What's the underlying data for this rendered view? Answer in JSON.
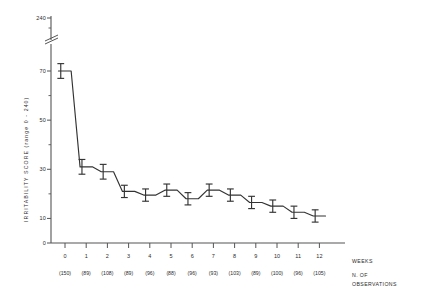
{
  "chart_data": {
    "type": "line",
    "title": "",
    "subtitle": "",
    "xlabel": "WEEKS",
    "ylabel": "IRRITABILITY SCORE  (range 0 - 240)",
    "ylabel_main": "IRRITABILITY SCORE",
    "ylabel_range": "(range 0 - 240)",
    "legend_position": "none",
    "grid": false,
    "axis_break": true,
    "axis_break_top_label": "240",
    "x": [
      0,
      1,
      2,
      3,
      4,
      5,
      6,
      7,
      8,
      9,
      10,
      11,
      12
    ],
    "categories": [
      "0",
      "1",
      "2",
      "3",
      "4",
      "5",
      "6",
      "7",
      "8",
      "9",
      "10",
      "11",
      "12"
    ],
    "values": [
      70.0,
      31.0,
      29.0,
      21.0,
      19.5,
      21.5,
      18.0,
      21.5,
      19.5,
      16.5,
      15.0,
      12.5,
      11.0
    ],
    "errors": [
      3.0,
      3.0,
      3.0,
      2.5,
      2.5,
      2.5,
      2.5,
      2.5,
      2.5,
      2.5,
      2.5,
      2.5,
      2.5
    ],
    "n_observations": [
      150,
      89,
      108,
      89,
      96,
      88,
      96,
      93,
      103,
      89,
      100,
      96,
      105
    ],
    "n_observations_display": [
      "(150)",
      "(89)",
      "(108)",
      "(89)",
      "(96)",
      "(88)",
      "(96)",
      "(93)",
      "(103)",
      "(89)",
      "(100)",
      "(96)",
      "(105)"
    ],
    "ylim": [
      0,
      80
    ],
    "ytick_labels": [
      "240",
      "70",
      "50",
      "30",
      "10",
      "0"
    ],
    "ymajor_ticks": [
      70,
      50,
      30,
      10,
      0
    ],
    "yminor_ticks": [
      60,
      40,
      20
    ],
    "xlim": [
      -0.5,
      12.5
    ],
    "series": [
      {
        "name": "Mean irritability score",
        "values": [
          70.0,
          31.0,
          29.0,
          21.0,
          19.5,
          21.5,
          18.0,
          21.5,
          19.5,
          16.5,
          15.0,
          12.5,
          11.0
        ]
      }
    ]
  },
  "axis": {
    "y_tick_240": "240",
    "y_tick_70": "70",
    "y_tick_50": "50",
    "y_tick_30": "30",
    "y_tick_10": "10",
    "y_tick_0": "0"
  },
  "footer": {
    "weeks_label": "WEEKS",
    "n_label_line1": "N. OF",
    "n_label_line2": "OBSERVATIONS"
  },
  "colors": {
    "line": "#333333",
    "axis": "#555555",
    "text": "#2b2b2b",
    "background": "#ffffff"
  }
}
